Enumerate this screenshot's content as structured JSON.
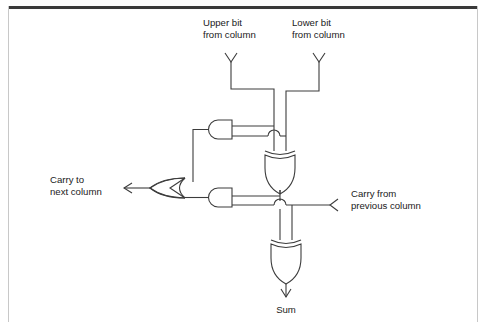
{
  "figure": {
    "diagram_type": "logic-circuit-schematic",
    "background_color": "#ffffff",
    "line_color": "#3c3c3c",
    "text_color": "#1a1a1a",
    "frame_rule_color": "#3a3a3a",
    "frame_side_rule_color": "#c8c8c8"
  },
  "labels": {
    "upper_bit_line1": "Upper bit",
    "upper_bit_line2": "from column",
    "lower_bit_line1": "Lower bit",
    "lower_bit_line2": "from column",
    "carry_to_line1": "Carry to",
    "carry_to_line2": "next column",
    "carry_from_line1": "Carry from",
    "carry_from_line2": "previous column",
    "sum": "Sum"
  },
  "gates": [
    {
      "id": "and-upper",
      "type": "AND",
      "orientation": "facing-left",
      "inputs": [
        "upper-bit",
        "lower-bit"
      ],
      "output": "or-gate-input-upper"
    },
    {
      "id": "xor-upper",
      "type": "XOR",
      "orientation": "facing-down",
      "inputs": [
        "upper-bit",
        "lower-bit"
      ],
      "output": "half-sum"
    },
    {
      "id": "and-lower",
      "type": "AND",
      "orientation": "facing-left",
      "inputs": [
        "half-sum",
        "carry-in"
      ],
      "output": "or-gate-input-lower"
    },
    {
      "id": "or-carry",
      "type": "OR",
      "orientation": "facing-left",
      "inputs": [
        "and-upper",
        "and-lower"
      ],
      "output": "carry-out"
    },
    {
      "id": "xor-sum",
      "type": "XOR",
      "orientation": "facing-down",
      "inputs": [
        "half-sum",
        "carry-in"
      ],
      "output": "sum"
    }
  ],
  "terminals": [
    {
      "id": "upper-bit",
      "label": "Upper bit from column",
      "direction": "input",
      "marker": "vee-down"
    },
    {
      "id": "lower-bit",
      "label": "Lower bit from column",
      "direction": "input",
      "marker": "vee-down"
    },
    {
      "id": "carry-in",
      "label": "Carry from previous column",
      "direction": "input",
      "marker": "vee-left"
    },
    {
      "id": "carry-out",
      "label": "Carry to next column",
      "direction": "output",
      "marker": "arrow-left"
    },
    {
      "id": "sum",
      "label": "Sum",
      "direction": "output",
      "marker": "arrow-down"
    }
  ],
  "wire_hops": [
    {
      "id": "hop-and-upper-over-lower-bit",
      "orientation": "up"
    },
    {
      "id": "hop-half-sum-over-carry-in",
      "orientation": "up"
    }
  ]
}
